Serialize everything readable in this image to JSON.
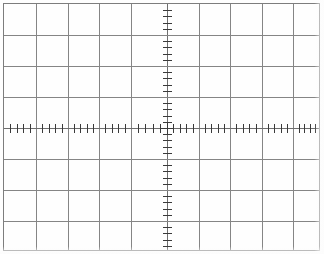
{
  "chart_data": {
    "type": "scatter",
    "title": "",
    "subtitle": "",
    "xlabel": "",
    "ylabel": "",
    "annotations": [],
    "legend_entries": [],
    "legend_position": "none",
    "grid": true,
    "grid_style": "oscilloscope-graticule",
    "divisions_horizontal": 10,
    "divisions_vertical": 8,
    "subdivisions_per_division": 5,
    "minor_ticks_per_division": 4,
    "xlim": [
      -5,
      5
    ],
    "ylim": [
      -4,
      4
    ],
    "x_tick_labels": [],
    "y_tick_labels": [],
    "x_major_values": [
      -5,
      -4,
      -3,
      -2,
      -1,
      0,
      1,
      2,
      3,
      4,
      5
    ],
    "y_major_values": [
      -4,
      -3,
      -2,
      -1,
      0,
      1,
      2,
      3,
      4
    ],
    "series": [],
    "values": [],
    "categories": []
  },
  "graticule": {
    "name_label": "Oscilloscope graticule",
    "colors": {
      "background": "#fefefe",
      "border": "#7d7d7d",
      "gridline": "#858585",
      "center_axis": "#6e6e6e",
      "tick": "#3a3a3a"
    },
    "geometry": {
      "screen_width": 324,
      "screen_height": 254,
      "frame_left": 3,
      "frame_top": 3,
      "frame_width": 317,
      "frame_height": 248,
      "columns": 10,
      "rows": 8,
      "column_width": 31.7,
      "row_height": 31.0,
      "center_x": 166,
      "center_y": 127,
      "tick_length": 9,
      "subdivision_count": 5
    },
    "vertical_gridline_positions": [
      3,
      35,
      67,
      98,
      130,
      166,
      198,
      229,
      261,
      292,
      320
    ],
    "horizontal_gridline_positions": [
      3,
      34,
      65,
      96,
      127,
      158,
      189,
      220,
      251
    ]
  }
}
